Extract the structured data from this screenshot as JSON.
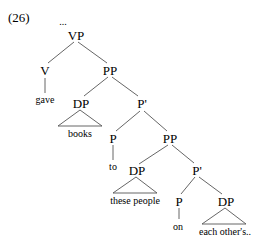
{
  "example_number": "(26)",
  "ellipsis": "...",
  "nodes": {
    "vp": {
      "label": "VP"
    },
    "v": {
      "label": "V"
    },
    "pp1": {
      "label": "PP"
    },
    "dp1": {
      "label": "DP"
    },
    "pbar1": {
      "label": "P'"
    },
    "p1": {
      "label": "P"
    },
    "pp2": {
      "label": "PP"
    },
    "dp2": {
      "label": "DP"
    },
    "pbar2": {
      "label": "P'"
    },
    "p2": {
      "label": "P"
    },
    "dp3": {
      "label": "DP"
    }
  },
  "leaves": {
    "gave": "gave",
    "books": "books",
    "to": "to",
    "these_people": "these people",
    "on": "on",
    "each_others": "each other's.."
  },
  "colors": {
    "line": "#555555",
    "text": "#000000"
  }
}
